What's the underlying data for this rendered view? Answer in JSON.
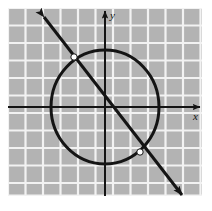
{
  "figure": {
    "canvas": {
      "width": 212,
      "height": 211,
      "background": "#ffffff"
    },
    "plot_area": {
      "x": 8,
      "y": 8,
      "width": 194,
      "height": 188,
      "background": "#b3b3b3",
      "grid": {
        "visible": true,
        "color": "#f2f2f2",
        "spacing": 17.5,
        "columns": 11,
        "rows": 11
      }
    },
    "axes": {
      "color": "#141414",
      "stroke_width": 2,
      "origin": {
        "x": 105,
        "y": 107
      },
      "x_axis": {
        "label": "x",
        "label_position": {
          "x": 196,
          "y": 119
        },
        "from": {
          "x": 8,
          "y": 107
        },
        "to": {
          "x": 203,
          "y": 107
        },
        "arrow": "right"
      },
      "y_axis": {
        "label": "y",
        "label_position": {
          "x": 112,
          "y": 18
        },
        "from": {
          "x": 105,
          "y": 196
        },
        "to": {
          "x": 105,
          "y": 8
        },
        "arrow": "up"
      }
    },
    "circle": {
      "name": "circle-curve",
      "center": {
        "x": 105,
        "y": 107
      },
      "radius_x": 54,
      "radius_y": 57,
      "stroke": "#141414",
      "stroke_width": 3,
      "fill": "none"
    },
    "line": {
      "name": "secant-line",
      "from": {
        "x": 40,
        "y": 12
      },
      "to": {
        "x": 186,
        "y": 200
      },
      "stroke": "#141414",
      "stroke_width": 3,
      "arrows": "both",
      "slope_direction": "negative-down-right"
    },
    "intersection_points": [
      {
        "name": "upper-left-intersection",
        "x": 74,
        "y": 57,
        "fill": "#ffffff",
        "stroke": "#141414",
        "radius": 3
      },
      {
        "name": "lower-right-intersection",
        "x": 140,
        "y": 152,
        "fill": "#ffffff",
        "stroke": "#141414",
        "radius": 3
      }
    ]
  }
}
